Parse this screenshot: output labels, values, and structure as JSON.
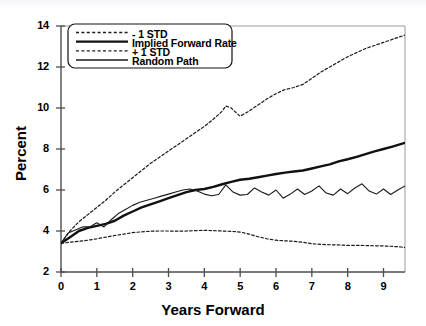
{
  "chart_data": {
    "type": "line",
    "title": "",
    "xlabel": "Years Forward",
    "ylabel": "Percent",
    "xlim": [
      0,
      9.6
    ],
    "ylim": [
      2,
      14
    ],
    "xticks": [
      0,
      1,
      2,
      3,
      4,
      5,
      6,
      7,
      8,
      9
    ],
    "yticks": [
      2,
      4,
      6,
      8,
      10,
      12,
      14
    ],
    "grid": false,
    "legend_position": "top-left",
    "series": [
      {
        "name": "- 1 STD",
        "style": "dashed",
        "width": 1.2,
        "color": "#1a1a1a",
        "x": [
          0,
          0.25,
          0.5,
          0.75,
          1.0,
          1.25,
          1.5,
          1.75,
          2.0,
          2.25,
          2.5,
          2.75,
          3.0,
          3.25,
          3.5,
          3.75,
          4.0,
          4.25,
          4.5,
          4.6,
          4.75,
          4.9,
          5.0,
          5.25,
          5.5,
          5.75,
          6.0,
          6.25,
          6.5,
          6.75,
          7.0,
          7.25,
          7.5,
          7.75,
          8.0,
          8.25,
          8.5,
          8.75,
          9.0,
          9.25,
          9.5,
          9.6
        ],
        "y": [
          3.4,
          4.0,
          4.45,
          4.8,
          5.15,
          5.5,
          5.9,
          6.25,
          6.6,
          6.95,
          7.3,
          7.6,
          7.9,
          8.2,
          8.5,
          8.8,
          9.1,
          9.45,
          9.85,
          10.1,
          10.0,
          9.75,
          9.6,
          9.85,
          10.15,
          10.45,
          10.7,
          10.9,
          11.0,
          11.15,
          11.45,
          11.75,
          12.0,
          12.25,
          12.5,
          12.7,
          12.9,
          13.05,
          13.2,
          13.35,
          13.5,
          13.55
        ]
      },
      {
        "name": "Implied Forward Rate",
        "style": "solid",
        "width": 2.4,
        "color": "#111111",
        "x": [
          0,
          0.25,
          0.5,
          0.75,
          1.0,
          1.25,
          1.5,
          1.75,
          2.0,
          2.25,
          2.5,
          2.75,
          3.0,
          3.25,
          3.5,
          3.75,
          4.0,
          4.25,
          4.5,
          4.75,
          5.0,
          5.25,
          5.5,
          5.75,
          6.0,
          6.25,
          6.5,
          6.75,
          7.0,
          7.25,
          7.5,
          7.75,
          8.0,
          8.25,
          8.5,
          8.75,
          9.0,
          9.25,
          9.5,
          9.6
        ],
        "y": [
          3.4,
          3.7,
          4.0,
          4.15,
          4.25,
          4.35,
          4.5,
          4.75,
          4.95,
          5.15,
          5.3,
          5.45,
          5.6,
          5.75,
          5.9,
          6.0,
          6.05,
          6.15,
          6.28,
          6.4,
          6.5,
          6.55,
          6.62,
          6.7,
          6.78,
          6.85,
          6.9,
          6.95,
          7.05,
          7.15,
          7.25,
          7.4,
          7.5,
          7.62,
          7.75,
          7.88,
          8.0,
          8.12,
          8.25,
          8.3
        ]
      },
      {
        "name": "+ 1 STD",
        "style": "dashed",
        "width": 1.2,
        "color": "#1a1a1a",
        "x": [
          0,
          0.25,
          0.5,
          0.75,
          1.0,
          1.25,
          1.5,
          1.75,
          2.0,
          2.25,
          2.5,
          2.75,
          3.0,
          3.25,
          3.5,
          3.75,
          4.0,
          4.25,
          4.5,
          4.75,
          5.0,
          5.25,
          5.5,
          5.75,
          6.0,
          6.25,
          6.5,
          6.75,
          7.0,
          7.25,
          7.5,
          7.75,
          8.0,
          8.25,
          8.5,
          8.75,
          9.0,
          9.25,
          9.5,
          9.6
        ],
        "y": [
          3.4,
          3.45,
          3.5,
          3.55,
          3.62,
          3.7,
          3.78,
          3.85,
          3.92,
          3.96,
          3.99,
          4.0,
          4.0,
          3.99,
          4.0,
          4.02,
          4.03,
          4.02,
          4.0,
          3.98,
          3.95,
          3.85,
          3.72,
          3.62,
          3.55,
          3.52,
          3.5,
          3.45,
          3.38,
          3.35,
          3.33,
          3.32,
          3.3,
          3.3,
          3.29,
          3.28,
          3.27,
          3.25,
          3.22,
          3.2
        ]
      },
      {
        "name": "Random Path",
        "style": "solid",
        "width": 1.1,
        "color": "#1a1a1a",
        "x": [
          0,
          0.2,
          0.4,
          0.6,
          0.8,
          1.0,
          1.2,
          1.4,
          1.6,
          1.8,
          2.0,
          2.2,
          2.4,
          2.6,
          2.8,
          3.0,
          3.2,
          3.4,
          3.6,
          3.8,
          4.0,
          4.2,
          4.4,
          4.6,
          4.8,
          5.0,
          5.2,
          5.4,
          5.6,
          5.8,
          6.0,
          6.2,
          6.4,
          6.6,
          6.8,
          7.0,
          7.2,
          7.4,
          7.6,
          7.8,
          8.0,
          8.2,
          8.4,
          8.6,
          8.8,
          9.0,
          9.2,
          9.4,
          9.6
        ],
        "y": [
          3.4,
          3.9,
          4.05,
          4.2,
          4.2,
          4.4,
          4.2,
          4.55,
          4.85,
          5.05,
          5.25,
          5.4,
          5.5,
          5.6,
          5.7,
          5.8,
          5.9,
          6.0,
          6.05,
          5.95,
          5.8,
          5.72,
          5.78,
          6.25,
          5.9,
          5.75,
          5.78,
          6.1,
          5.9,
          5.75,
          6.0,
          5.6,
          5.8,
          6.05,
          5.78,
          5.95,
          6.2,
          5.85,
          5.75,
          6.05,
          5.82,
          6.1,
          6.3,
          5.95,
          5.8,
          6.05,
          5.78,
          6.0,
          6.2
        ]
      }
    ]
  },
  "legend": {
    "entries": [
      {
        "label": "- 1 STD"
      },
      {
        "label": "Implied Forward Rate"
      },
      {
        "label": "+ 1 STD"
      },
      {
        "label": "Random Path"
      }
    ]
  },
  "axes": {
    "x_title": "Years Forward",
    "y_title": "Percent",
    "x_tick_labels": [
      "0",
      "1",
      "2",
      "3",
      "4",
      "5",
      "6",
      "7",
      "8",
      "9"
    ],
    "y_tick_labels": [
      "2",
      "4",
      "6",
      "8",
      "10",
      "12",
      "14"
    ]
  }
}
